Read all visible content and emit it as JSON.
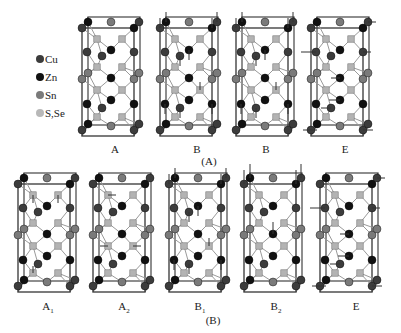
{
  "legend": {
    "items": [
      {
        "label": "Cu",
        "color": "#3c3c3c"
      },
      {
        "label": "Zn",
        "color": "#111111"
      },
      {
        "label": "Sn",
        "color": "#7a7a7a"
      },
      {
        "label": "S,Se",
        "color": "#b8b8b8"
      }
    ]
  },
  "colors": {
    "Cu": "#3c3c3c",
    "Zn": "#111111",
    "Sn": "#7a7a7a",
    "S": "#b3b3b3",
    "frame": "#444444",
    "bond": "#9a9a9a",
    "arrow": "#333333"
  },
  "groups": [
    {
      "label": "(A)",
      "x": 209,
      "y": 155
    },
    {
      "label": "(B)",
      "x": 213,
      "y": 314
    }
  ],
  "panels": [
    {
      "id": "A-A",
      "label": "A",
      "sub": "",
      "x": 82,
      "y": 22,
      "label_x": 115,
      "label_y": 143,
      "arrows": "none"
    },
    {
      "id": "A-B1",
      "label": "B",
      "sub": "",
      "x": 160,
      "y": 22,
      "label_x": 197,
      "label_y": 143,
      "arrows": "vertical"
    },
    {
      "id": "A-B2",
      "label": "B",
      "sub": "",
      "x": 236,
      "y": 22,
      "label_x": 266,
      "label_y": 143,
      "arrows": "vertical"
    },
    {
      "id": "A-E",
      "label": "E",
      "sub": "",
      "x": 311,
      "y": 22,
      "label_x": 345,
      "label_y": 143,
      "arrows": "horizontal"
    },
    {
      "id": "B-A1",
      "label": "A",
      "sub": "1",
      "x": 18,
      "y": 178,
      "label_x": 48,
      "label_y": 300,
      "arrows": "small"
    },
    {
      "id": "B-A2",
      "label": "A",
      "sub": "2",
      "x": 93,
      "y": 178,
      "label_x": 124,
      "label_y": 300,
      "arrows": "small-h"
    },
    {
      "id": "B-B1",
      "label": "B",
      "sub": "1",
      "x": 169,
      "y": 178,
      "label_x": 200,
      "label_y": 300,
      "arrows": "vertical"
    },
    {
      "id": "B-B2",
      "label": "B",
      "sub": "2",
      "x": 244,
      "y": 178,
      "label_x": 276,
      "label_y": 300,
      "arrows": "vertical-top"
    },
    {
      "id": "B-E",
      "label": "E",
      "sub": "",
      "x": 320,
      "y": 178,
      "label_x": 356,
      "label_y": 300,
      "arrows": "horizontal"
    }
  ],
  "unit_cell": {
    "width": 52,
    "height": 108,
    "depth_dx": 6,
    "depth_dy": -5,
    "atoms": [
      {
        "t": "Cu",
        "x": 0,
        "y": 6
      },
      {
        "t": "Zn",
        "x": 6,
        "y": 0
      },
      {
        "t": "Sn",
        "x": 29,
        "y": 0
      },
      {
        "t": "Zn",
        "x": 52,
        "y": 6
      },
      {
        "t": "Cu",
        "x": 57,
        "y": 0
      },
      {
        "t": "S",
        "x": 15,
        "y": 17
      },
      {
        "t": "S",
        "x": 40,
        "y": 17
      },
      {
        "t": "Cu",
        "x": 5,
        "y": 30
      },
      {
        "t": "Zn",
        "x": 29,
        "y": 28
      },
      {
        "t": "Cu",
        "x": 20,
        "y": 34
      },
      {
        "t": "Cu",
        "x": 52,
        "y": 30
      },
      {
        "t": "S",
        "x": 15,
        "y": 45
      },
      {
        "t": "S",
        "x": 40,
        "y": 45
      },
      {
        "t": "Sn",
        "x": 0,
        "y": 57
      },
      {
        "t": "Sn",
        "x": 6,
        "y": 51
      },
      {
        "t": "Zn",
        "x": 29,
        "y": 56
      },
      {
        "t": "Sn",
        "x": 52,
        "y": 57
      },
      {
        "t": "Sn",
        "x": 57,
        "y": 51
      },
      {
        "t": "S",
        "x": 15,
        "y": 68
      },
      {
        "t": "S",
        "x": 40,
        "y": 68
      },
      {
        "t": "Zn",
        "x": 5,
        "y": 82
      },
      {
        "t": "Cu",
        "x": 20,
        "y": 86
      },
      {
        "t": "Zn",
        "x": 29,
        "y": 78
      },
      {
        "t": "Zn",
        "x": 52,
        "y": 82
      },
      {
        "t": "S",
        "x": 15,
        "y": 95
      },
      {
        "t": "S",
        "x": 40,
        "y": 95
      },
      {
        "t": "Cu",
        "x": 0,
        "y": 108
      },
      {
        "t": "Zn",
        "x": 6,
        "y": 102
      },
      {
        "t": "Sn",
        "x": 29,
        "y": 104
      },
      {
        "t": "Cu",
        "x": 52,
        "y": 108
      },
      {
        "t": "Cu",
        "x": 57,
        "y": 102
      }
    ]
  }
}
